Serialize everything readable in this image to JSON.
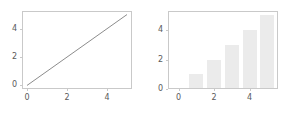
{
  "figure": {
    "background_color": "#ffffff",
    "width": 294,
    "height": 114
  },
  "chart_data": [
    {
      "id": "left",
      "type": "line",
      "title": "",
      "xlabel": "",
      "ylabel": "",
      "x": [
        0,
        1,
        2,
        3,
        4,
        5
      ],
      "values": [
        0,
        1,
        2,
        3,
        4,
        5
      ],
      "series": [
        {
          "name": "y = x",
          "values": [
            0,
            1,
            2,
            3,
            4,
            5
          ]
        }
      ],
      "xlim": [
        -0.25,
        5.25
      ],
      "ylim": [
        -0.25,
        5.25
      ],
      "xticks": [
        0,
        2,
        4
      ],
      "yticks": [
        0,
        2,
        4
      ],
      "xtick_labels": [
        "0",
        "2",
        "4"
      ],
      "ytick_labels": [
        "0",
        "2",
        "4"
      ],
      "grid": false,
      "legend": null,
      "line_color": "#8c8c8c",
      "spine_color": "#c9c9c9",
      "tick_label_color": "#5a5a5a"
    },
    {
      "id": "right",
      "type": "bar",
      "title": "",
      "xlabel": "",
      "ylabel": "",
      "categories": [
        "0",
        "1",
        "2",
        "3",
        "4",
        "5"
      ],
      "x": [
        0,
        1,
        2,
        3,
        4,
        5
      ],
      "values": [
        0,
        1,
        2,
        3,
        4,
        5
      ],
      "series": [
        {
          "name": "counts",
          "values": [
            0,
            1,
            2,
            3,
            4,
            5
          ]
        }
      ],
      "xlim": [
        -0.6,
        5.6
      ],
      "ylim": [
        0,
        5.3
      ],
      "xticks": [
        0,
        2,
        4
      ],
      "yticks": [
        0,
        2,
        4
      ],
      "xtick_labels": [
        "0",
        "2",
        "4"
      ],
      "ytick_labels": [
        "0",
        "2",
        "4"
      ],
      "bar_width": 0.8,
      "grid": false,
      "legend": null,
      "bar_color": "#ebebeb",
      "spine_color": "#c9c9c9",
      "tick_label_color": "#5a5a5a"
    }
  ]
}
